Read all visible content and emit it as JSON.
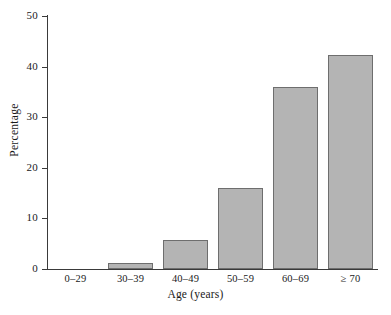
{
  "chart_data": {
    "type": "bar",
    "title": "",
    "xlabel": "Age (years)",
    "ylabel": "Percentage",
    "categories": [
      "0–29",
      "30–39",
      "40–49",
      "50–59",
      "60–69",
      "≥ 70"
    ],
    "values": [
      0,
      1.2,
      5.7,
      16.1,
      36.0,
      42.3
    ],
    "ylim": [
      0,
      50
    ],
    "yticks": [
      0,
      10,
      20,
      30,
      40,
      50
    ],
    "ytick_labels": [
      "0",
      "10",
      "20",
      "30",
      "40",
      "50"
    ],
    "xlim_categories": 6,
    "grid": false,
    "legend": "none",
    "bar_fill_color": "#b4b4b4",
    "bar_border_color": "#6e6e6e",
    "axis_color": "#3a3a3a",
    "background_color": "#ffffff"
  }
}
